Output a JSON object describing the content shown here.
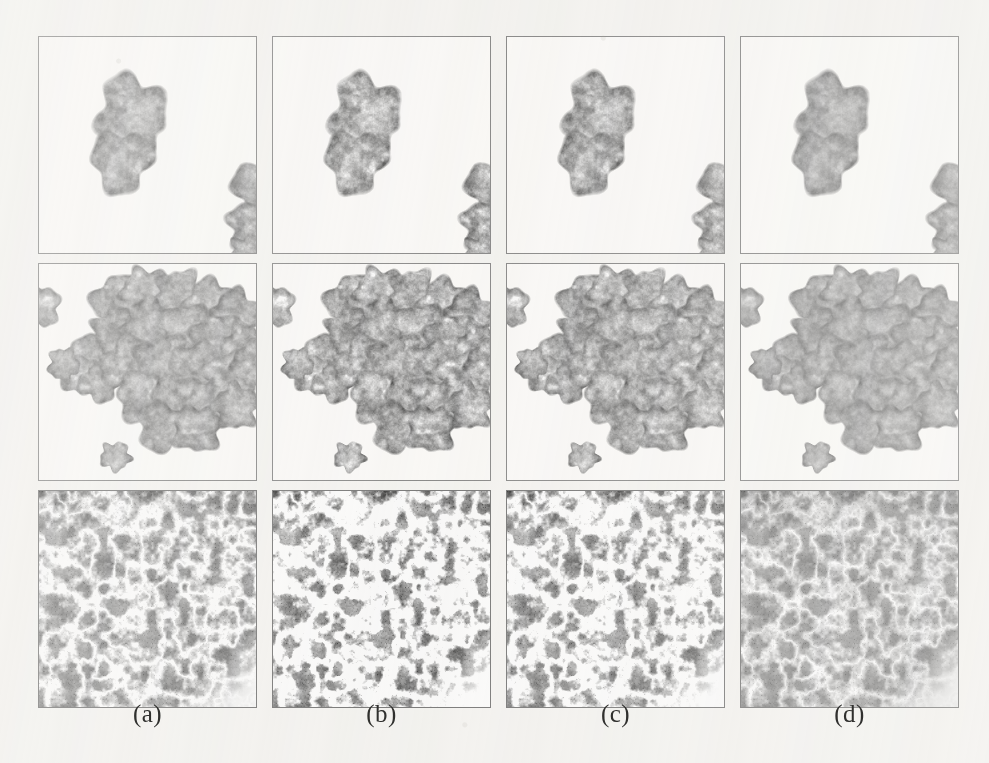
{
  "figure": {
    "type": "image-grid",
    "domain": "histopathology-micrographs",
    "rows": 3,
    "columns": 4,
    "background_color": "#f4f3f0",
    "panel_border_color": "#6f6f6f",
    "panel_background": "#fbfaf8",
    "caption_color": "#30302e",
    "columns_meta": [
      {
        "label": "(a)",
        "name": "column-a"
      },
      {
        "label": "(b)",
        "name": "column-b"
      },
      {
        "label": "(c)",
        "name": "column-c"
      },
      {
        "label": "(d)",
        "name": "column-d"
      }
    ],
    "rows_meta": [
      {
        "name": "row-sparse-fragments",
        "content": "two small tissue fragments on white background"
      },
      {
        "name": "row-tissue-cluster",
        "content": "large lobulated tissue cluster with small round fragment below"
      },
      {
        "name": "row-glandular-field",
        "content": "dense glandular tissue field filling the frame"
      }
    ],
    "panels": [
      {
        "row": 0,
        "col": 0,
        "name": "panel-r1-a",
        "tone": 0.0,
        "contrast": 1.0,
        "detail": 1.0
      },
      {
        "row": 0,
        "col": 1,
        "name": "panel-r1-b",
        "tone": 0.06,
        "contrast": 1.18,
        "detail": 1.25
      },
      {
        "row": 0,
        "col": 2,
        "name": "panel-r1-c",
        "tone": 0.05,
        "contrast": 1.12,
        "detail": 1.18
      },
      {
        "row": 0,
        "col": 3,
        "name": "panel-r1-d",
        "tone": 0.02,
        "contrast": 0.95,
        "detail": 0.85
      },
      {
        "row": 1,
        "col": 0,
        "name": "panel-r2-a",
        "tone": 0.0,
        "contrast": 1.0,
        "detail": 1.0
      },
      {
        "row": 1,
        "col": 1,
        "name": "panel-r2-b",
        "tone": 0.06,
        "contrast": 1.18,
        "detail": 1.25
      },
      {
        "row": 1,
        "col": 2,
        "name": "panel-r2-c",
        "tone": 0.05,
        "contrast": 1.12,
        "detail": 1.18
      },
      {
        "row": 1,
        "col": 3,
        "name": "panel-r2-d",
        "tone": 0.02,
        "contrast": 0.95,
        "detail": 0.85
      },
      {
        "row": 2,
        "col": 0,
        "name": "panel-r3-a",
        "tone": 0.0,
        "contrast": 1.0,
        "detail": 1.0
      },
      {
        "row": 2,
        "col": 1,
        "name": "panel-r3-b",
        "tone": 0.08,
        "contrast": 1.22,
        "detail": 1.3
      },
      {
        "row": 2,
        "col": 2,
        "name": "panel-r3-c",
        "tone": 0.06,
        "contrast": 1.14,
        "detail": 1.2
      },
      {
        "row": 2,
        "col": 3,
        "name": "panel-r3-d",
        "tone": 0.03,
        "contrast": 0.92,
        "detail": 0.8
      }
    ]
  }
}
